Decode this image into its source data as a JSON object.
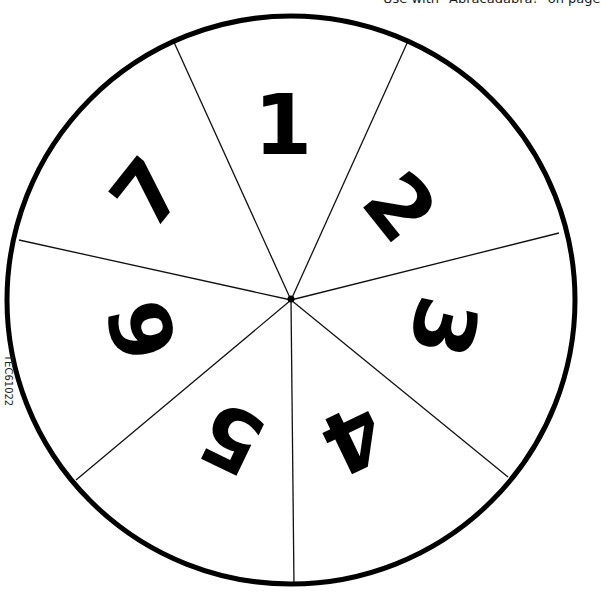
{
  "caption": "Use with \"Abracadabra!\" on page",
  "product_code": "TEC61022",
  "spinner": {
    "center": [
      291,
      300
    ],
    "radius": 286,
    "sections": [
      {
        "label": "1",
        "cx": 283,
        "cy": 125,
        "rot": 0
      },
      {
        "label": "2",
        "cx": 400,
        "cy": 207,
        "rot": 51.4
      },
      {
        "label": "3",
        "cx": 443,
        "cy": 327,
        "rot": 102.9
      },
      {
        "label": "4",
        "cx": 353,
        "cy": 438,
        "rot": 154.3
      },
      {
        "label": "5",
        "cx": 232,
        "cy": 438,
        "rot": 205.7
      },
      {
        "label": "6",
        "cx": 143,
        "cy": 330,
        "rot": 257.1
      },
      {
        "label": "7",
        "cx": 148,
        "cy": 193,
        "rot": 308.6
      }
    ]
  }
}
